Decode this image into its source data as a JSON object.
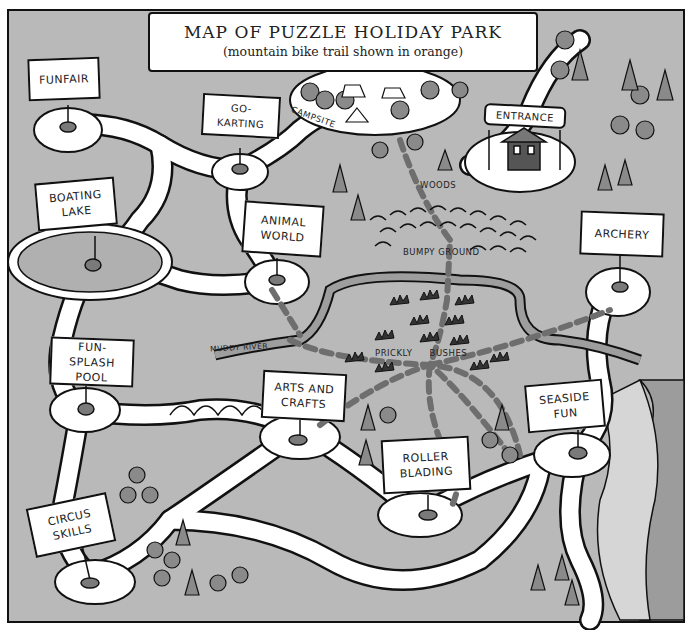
{
  "title": {
    "main": "MAP OF PUZZLE HOLIDAY PARK",
    "subtitle": "(mountain bike trail shown in orange)"
  },
  "colors": {
    "background": "#b9b9b9",
    "path": "#ffffff",
    "outline": "#111111",
    "trail": "#6e6e6e",
    "tree": "#8a8a8a",
    "water": "#a8a8a8",
    "sea": "#9c9c9c"
  },
  "signs": [
    {
      "id": "funfair",
      "label": "Funfair"
    },
    {
      "id": "go-karting",
      "label": "Go-Karting"
    },
    {
      "id": "boating-lake",
      "label": "Boating\nLake"
    },
    {
      "id": "animal-world",
      "label": "Animal\nWorld"
    },
    {
      "id": "archery",
      "label": "Archery"
    },
    {
      "id": "fun-splash-pool",
      "label": "Fun-Splash\nPool"
    },
    {
      "id": "arts-and-crafts",
      "label": "Arts and\nCrafts"
    },
    {
      "id": "seaside-fun",
      "label": "Seaside\nFun"
    },
    {
      "id": "roller-blading",
      "label": "Roller\nBlading"
    },
    {
      "id": "circus-skills",
      "label": "Circus\nSkills"
    },
    {
      "id": "entrance",
      "label": "Entrance"
    }
  ],
  "area_labels": {
    "campsite": "Campsite",
    "woods": "Woods",
    "bumpy_ground": "Bumpy Ground",
    "prickly_bushes": "Prickly Bushes",
    "muddy_river": "Muddy River"
  }
}
